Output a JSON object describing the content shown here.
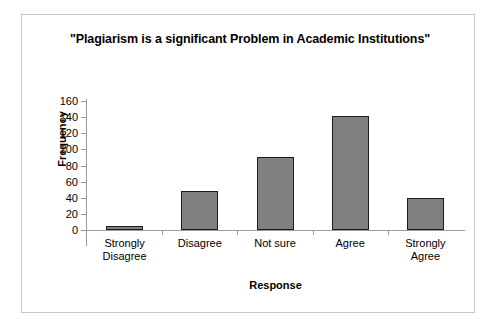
{
  "chart_data": {
    "type": "bar",
    "title": "\"Plagiarism is a significant Problem in Academic Institutions\"",
    "xlabel": "Response",
    "ylabel": "Frequency",
    "categories": [
      "Strongly Disagree",
      "Disagree",
      "Not sure",
      "Agree",
      "Strongly Agree"
    ],
    "category_lines": [
      [
        "Strongly",
        "Disagree"
      ],
      [
        "Disagree",
        ""
      ],
      [
        "Not sure",
        ""
      ],
      [
        "Agree",
        ""
      ],
      [
        "Strongly",
        "Agree"
      ]
    ],
    "values": [
      5,
      48,
      90,
      141,
      40
    ],
    "ylim": [
      0,
      160
    ],
    "ytick_labels": [
      "160",
      "140",
      "120",
      "100",
      "80",
      "60",
      "40",
      "20",
      "0"
    ],
    "ytick_values": [
      160,
      140,
      120,
      100,
      80,
      60,
      40,
      20,
      0
    ],
    "ytick_step": 20,
    "grid": false,
    "legend": false,
    "bar_color": "#808080",
    "bar_border_color": "#1c1c1c",
    "axis_color": "#9a9a9a",
    "frame_border_color": "#c8c8c8",
    "background": "#ffffff"
  }
}
